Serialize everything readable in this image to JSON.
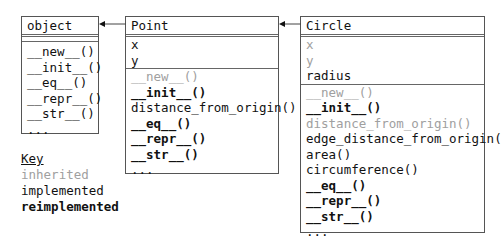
{
  "classes": {
    "object": {
      "name": "object",
      "attributes": [],
      "methods": [
        {
          "label": "__new__()",
          "kind": "implemented"
        },
        {
          "label": "__init__()",
          "kind": "implemented"
        },
        {
          "label": "__eq__()",
          "kind": "implemented"
        },
        {
          "label": "__repr__()",
          "kind": "implemented"
        },
        {
          "label": "__str__()",
          "kind": "implemented"
        },
        {
          "label": "...",
          "kind": "implemented"
        }
      ]
    },
    "point": {
      "name": "Point",
      "attributes": [
        {
          "label": "x",
          "kind": "implemented"
        },
        {
          "label": "y",
          "kind": "implemented"
        }
      ],
      "methods": [
        {
          "label": "__new__()",
          "kind": "inherited"
        },
        {
          "label": "__init__()",
          "kind": "reimplemented"
        },
        {
          "label": "distance_from_origin()",
          "kind": "implemented"
        },
        {
          "label": "__eq__()",
          "kind": "reimplemented"
        },
        {
          "label": "__repr__()",
          "kind": "reimplemented"
        },
        {
          "label": "__str__()",
          "kind": "reimplemented"
        },
        {
          "label": "...",
          "kind": "implemented"
        }
      ]
    },
    "circle": {
      "name": "Circle",
      "attributes": [
        {
          "label": "x",
          "kind": "inherited"
        },
        {
          "label": "y",
          "kind": "inherited"
        },
        {
          "label": "radius",
          "kind": "implemented"
        }
      ],
      "methods": [
        {
          "label": "__new__()",
          "kind": "inherited"
        },
        {
          "label": "__init__()",
          "kind": "reimplemented"
        },
        {
          "label": "distance_from_origin()",
          "kind": "inherited"
        },
        {
          "label": "edge_distance_from_origin()",
          "kind": "implemented"
        },
        {
          "label": "area()",
          "kind": "implemented"
        },
        {
          "label": "circumference()",
          "kind": "implemented"
        },
        {
          "label": "__eq__()",
          "kind": "reimplemented"
        },
        {
          "label": "__repr__()",
          "kind": "reimplemented"
        },
        {
          "label": "__str__()",
          "kind": "reimplemented"
        },
        {
          "label": "...",
          "kind": "implemented"
        }
      ]
    }
  },
  "relations": [
    {
      "from": "Point",
      "to": "object",
      "type": "inheritance"
    },
    {
      "from": "Circle",
      "to": "Point",
      "type": "inheritance"
    }
  ],
  "key": {
    "title": "Key",
    "items": [
      {
        "label": "inherited",
        "kind": "inherited"
      },
      {
        "label": "implemented",
        "kind": "implemented"
      },
      {
        "label": "reimplemented",
        "kind": "reimplemented"
      }
    ]
  },
  "colors": {
    "inherited": "#a0a0a0",
    "implemented": "#111111",
    "border": "#555555"
  }
}
